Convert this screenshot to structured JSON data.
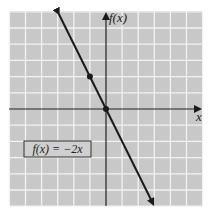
{
  "chart_data": {
    "type": "line",
    "title": "",
    "xlabel": "x",
    "ylabel": "f(x)",
    "xlim": [
      -6,
      6
    ],
    "ylim": [
      -6,
      6
    ],
    "grid": true,
    "legend_position": "lower-left",
    "series": [
      {
        "name": "f(x) = −2x",
        "x": [
          -3,
          3
        ],
        "y": [
          6,
          -6
        ],
        "arrows": "both"
      }
    ],
    "points": [
      {
        "x": -1,
        "y": 2
      },
      {
        "x": 0,
        "y": 0
      }
    ],
    "annotations": [
      {
        "text": "f(x) = −2x",
        "boxed": true
      }
    ]
  },
  "labels": {
    "y_axis": "f(x)",
    "x_axis": "x",
    "equation": "f(x) = −2x"
  },
  "colors": {
    "grid_bg": "#c8c8c8",
    "grid_line": "#f0f0f0",
    "axis": "#222222",
    "line": "#1a1a1a"
  }
}
